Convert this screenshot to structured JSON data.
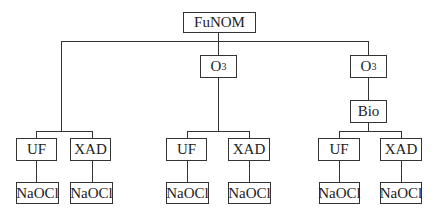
{
  "root": {
    "label": "FuNOM"
  },
  "branches": [
    {
      "steps": [],
      "children": [
        {
          "label": "UF",
          "next": "NaOCl"
        },
        {
          "label": "XAD",
          "next": "NaOCl"
        }
      ]
    },
    {
      "steps": [
        {
          "label": "O",
          "sub": "3"
        }
      ],
      "children": [
        {
          "label": "UF",
          "next": "NaOCl"
        },
        {
          "label": "XAD",
          "next": "NaOCl"
        }
      ]
    },
    {
      "steps": [
        {
          "label": "O",
          "sub": "3"
        },
        {
          "label": "Bio"
        }
      ],
      "children": [
        {
          "label": "UF",
          "next": "NaOCl"
        },
        {
          "label": "XAD",
          "next": "NaOCl"
        }
      ]
    }
  ]
}
